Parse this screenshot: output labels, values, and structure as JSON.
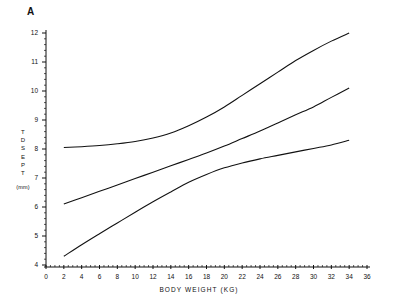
{
  "figure": {
    "panel_label": "A",
    "background_color": "#ffffff",
    "line_color": "#111111"
  },
  "chart_data": {
    "type": "line",
    "title": "A",
    "xlabel": "BODY WEIGHT (KG)",
    "ylabel": "TD SEPT (mm)",
    "ylabel_vertical_chars": [
      "T",
      "D",
      "S",
      "E",
      "P",
      "T"
    ],
    "ylabel_unit": "(mm)",
    "xlim": [
      0,
      36
    ],
    "ylim": [
      4,
      12
    ],
    "xticks": [
      0,
      2,
      4,
      6,
      8,
      10,
      12,
      14,
      16,
      18,
      20,
      22,
      24,
      26,
      28,
      30,
      32,
      34,
      36
    ],
    "yticks": [
      4,
      5,
      6,
      7,
      8,
      9,
      10,
      11,
      12
    ],
    "grid": false,
    "legend": "none",
    "x": [
      2,
      4,
      6,
      8,
      10,
      12,
      14,
      16,
      18,
      20,
      22,
      24,
      26,
      28,
      30,
      32,
      34
    ],
    "series": [
      {
        "name": "upper",
        "values": [
          8.05,
          8.08,
          8.12,
          8.18,
          8.26,
          8.38,
          8.55,
          8.8,
          9.1,
          9.45,
          9.85,
          10.25,
          10.65,
          11.05,
          11.4,
          11.72,
          12.0
        ]
      },
      {
        "name": "middle",
        "values": [
          6.1,
          6.32,
          6.54,
          6.76,
          6.98,
          7.2,
          7.42,
          7.64,
          7.86,
          8.1,
          8.36,
          8.62,
          8.9,
          9.18,
          9.45,
          9.78,
          10.1
        ]
      },
      {
        "name": "lower",
        "values": [
          4.3,
          4.7,
          5.08,
          5.45,
          5.82,
          6.18,
          6.52,
          6.85,
          7.12,
          7.35,
          7.52,
          7.66,
          7.78,
          7.9,
          8.02,
          8.14,
          8.3
        ]
      }
    ]
  }
}
